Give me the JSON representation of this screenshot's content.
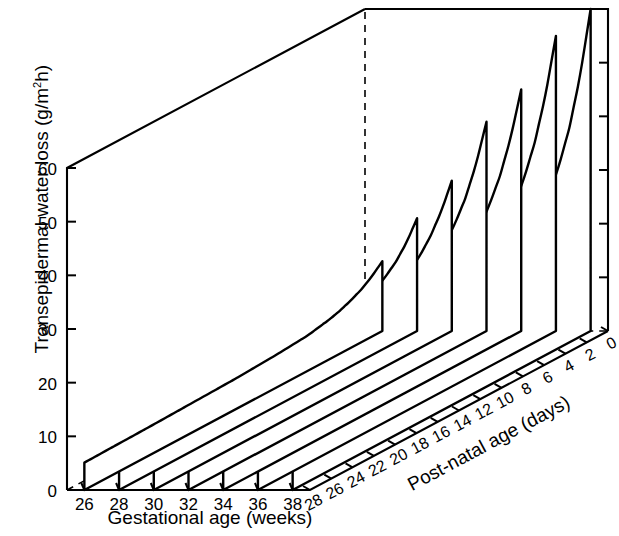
{
  "figure": {
    "kind": "3d-surface-ribbon-plot",
    "background": "#ffffff",
    "ink_color": "#000000"
  },
  "axes": {
    "y": {
      "label_prefix": "Transepidermal water loss (g/m",
      "label_sup": "2",
      "label_suffix": "h)",
      "label_full": "Transepidermal water loss (g/m2h)",
      "ticks": [
        "0",
        "10",
        "20",
        "30",
        "40",
        "50",
        "60"
      ],
      "min": 0,
      "max": 60
    },
    "x": {
      "label": "Gestational age (weeks)",
      "ticks": [
        "26",
        "28",
        "30",
        "32",
        "34",
        "36",
        "38"
      ],
      "min": 25,
      "max": 39
    },
    "z": {
      "label": "Post-natal age (days)",
      "ticks": [
        "28",
        "26",
        "24",
        "22",
        "20",
        "18",
        "16",
        "14",
        "12",
        "10",
        "8",
        "6",
        "4",
        "2",
        "0"
      ],
      "min": 0,
      "max": 28,
      "direction": "reversed-front-to-back"
    }
  },
  "chart_data": {
    "type": "line",
    "title": "",
    "xlabel": "Gestational age (weeks)",
    "ylabel": "Transepidermal water loss (g/m2h)",
    "zlabel": "Post-natal age (days)",
    "xlim": [
      25,
      39
    ],
    "ylim": [
      0,
      60
    ],
    "zlim": [
      0,
      28
    ],
    "grid": false,
    "legend": "none",
    "x": [
      0,
      1,
      2,
      3,
      4,
      5,
      7,
      10,
      14,
      18,
      22,
      25,
      28
    ],
    "x_units": "post-natal age (days)",
    "series": [
      {
        "name": "26 weeks",
        "gestational_age": 26,
        "values": [
          13.0,
          11.2,
          9.8,
          8.8,
          8.0,
          7.4,
          6.6,
          6.1,
          5.7,
          5.5,
          5.3,
          5.2,
          5.1
        ]
      },
      {
        "name": "28 weeks",
        "gestational_age": 28,
        "values": [
          21.0,
          17.5,
          15.0,
          13.2,
          11.8,
          10.8,
          9.4,
          8.3,
          7.5,
          7.1,
          6.8,
          6.7,
          6.6
        ]
      },
      {
        "name": "30 weeks",
        "gestational_age": 30,
        "values": [
          28.0,
          23.3,
          19.8,
          17.2,
          15.3,
          13.8,
          11.8,
          10.2,
          9.1,
          8.5,
          8.2,
          8.0,
          7.9
        ]
      },
      {
        "name": "32 weeks",
        "gestational_age": 32,
        "values": [
          39.0,
          32.0,
          26.8,
          23.0,
          20.2,
          18.1,
          15.2,
          12.9,
          11.3,
          10.5,
          10.0,
          9.8,
          9.7
        ]
      },
      {
        "name": "34 weeks",
        "gestational_age": 34,
        "values": [
          45.0,
          37.0,
          31.0,
          26.6,
          23.3,
          20.8,
          17.4,
          14.7,
          12.9,
          11.9,
          11.4,
          11.1,
          11.0
        ]
      },
      {
        "name": "36 weeks",
        "gestational_age": 36,
        "values": [
          55.0,
          44.8,
          37.2,
          31.6,
          27.4,
          24.2,
          19.9,
          16.5,
          14.2,
          13.0,
          12.3,
          12.0,
          11.9
        ]
      },
      {
        "name": "38 weeks",
        "gestational_age": 38,
        "values": [
          60.0,
          48.5,
          40.0,
          33.8,
          29.2,
          25.7,
          20.9,
          17.1,
          14.6,
          13.3,
          12.6,
          12.3,
          12.2
        ]
      }
    ]
  }
}
